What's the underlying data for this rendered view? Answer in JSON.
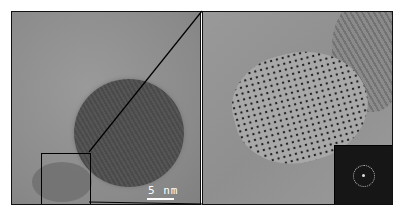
{
  "figure": {
    "left_panel": {
      "description": "TEM image of spherical nanoparticle with marked region",
      "scale_bar_label": "5 nm"
    },
    "right_panel": {
      "description": "High-resolution zoom of marked region showing atomic lattice",
      "inset": "FFT pattern"
    },
    "colors": {
      "frame": "#111111",
      "scale_bar": "#ffffff",
      "fft_bg": "#161616"
    }
  }
}
